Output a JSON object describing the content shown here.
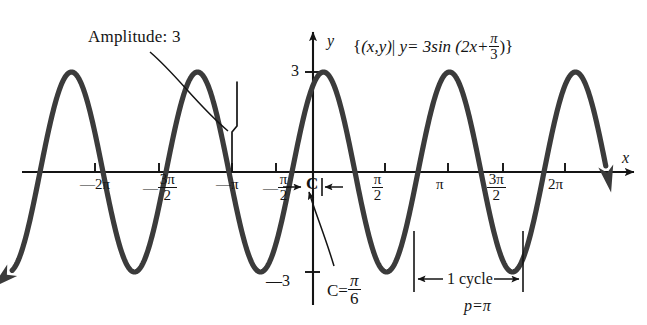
{
  "figure": {
    "title_equation": "{(x,y)| y= 3sin (2x+ π/3)}",
    "curve_color": "#3b3b3b",
    "axis_color": "#141414"
  },
  "annotations": {
    "amplitude": "Amplitude:  3",
    "c_marker": "C",
    "cycle": "1 cycle"
  },
  "axes": {
    "y_label": "y",
    "x_label": "x",
    "y_ticks": [
      {
        "label": "3",
        "value": 3
      },
      {
        "label": "—3",
        "value": -3
      }
    ],
    "x_ticks": [
      {
        "label": "—2π",
        "value": -6.2832
      },
      {
        "label": "—",
        "frac_num": "3π",
        "frac_den": "2",
        "value": -4.7124
      },
      {
        "label": "—π",
        "value": -3.1416
      },
      {
        "label": "—",
        "frac_num": "π",
        "frac_den": "2",
        "value": -1.5708
      },
      {
        "label": "",
        "frac_num": "π",
        "frac_den": "2",
        "value": 1.5708
      },
      {
        "label": "π",
        "value": 3.1416
      },
      {
        "label": "",
        "frac_num": "3π",
        "frac_den": "2",
        "value": 4.7124
      },
      {
        "label": "2π",
        "value": 6.2832
      }
    ]
  },
  "equation_parts": {
    "open_brace": "{",
    "set_pair": "(x,y)",
    "bar": "|",
    "y_eq": "y= 3sin (2x+",
    "frac_num": "π",
    "frac_den": "3",
    "close": ")}"
  },
  "c_value": {
    "prefix": "C=",
    "frac_num": "π",
    "frac_den": "6"
  },
  "period": {
    "prefix": "p=",
    "value": "π"
  },
  "chart_data": {
    "type": "line",
    "xlabel": "x",
    "ylabel": "y",
    "amplitude": 3,
    "period": 3.14159,
    "phase_shift": -0.5236,
    "frequency": 2,
    "equation": "y = 3 sin(2x + pi/3)",
    "xlim": [
      -7.5,
      7.3
    ],
    "ylim": [
      -3.6,
      3.6
    ],
    "grid": false,
    "legend": null,
    "x_tick_values": [
      -6.2832,
      -4.7124,
      -3.1416,
      -1.5708,
      1.5708,
      3.1416,
      4.7124,
      6.2832
    ],
    "x_tick_labels": [
      "-2π",
      "-3π/2",
      "-π",
      "-π/2",
      "π/2",
      "π",
      "3π/2",
      "2π"
    ],
    "y_tick_values": [
      3,
      -3
    ],
    "y_tick_labels": [
      "3",
      "-3"
    ],
    "annotations": [
      {
        "text": "Amplitude:  3",
        "points_to_x": -3.1416,
        "points_to_y": 1.5
      },
      {
        "text": "C",
        "at_x": -0.26,
        "at_y": 0
      },
      {
        "text": "C= π/6",
        "points_to_x": -0.5236,
        "points_to_y": -0.6
      },
      {
        "text": "1 cycle",
        "from_x": 2.618,
        "to_x": 5.7596
      },
      {
        "text": "p= π"
      }
    ]
  }
}
